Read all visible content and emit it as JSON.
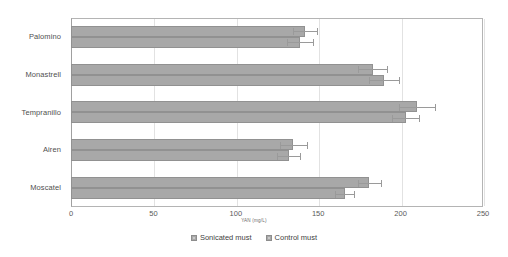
{
  "chart_data": {
    "type": "bar",
    "orientation": "horizontal",
    "title": "",
    "xlabel": "YAN (mg/L)",
    "ylabel": "",
    "xlim": [
      0,
      250
    ],
    "xticks": [
      0,
      50,
      100,
      150,
      200,
      250
    ],
    "grid": true,
    "legend_position": "bottom",
    "categories": [
      "Palomino",
      "Monastrell",
      "Tempranillo",
      "Airen",
      "Moscatel"
    ],
    "series": [
      {
        "name": "Sonicated must",
        "color": "#a8a8a8",
        "values": [
          142,
          183,
          210,
          135,
          181
        ],
        "errors": [
          7,
          9,
          11,
          8,
          7
        ]
      },
      {
        "name": "Control must",
        "color": "#a8a8a8",
        "values": [
          139,
          190,
          203,
          132,
          166
        ],
        "errors": [
          8,
          9,
          8,
          7,
          6
        ]
      }
    ]
  },
  "axis": {
    "x_tick_labels": [
      "0",
      "50",
      "100",
      "150",
      "200",
      "250"
    ],
    "x_title": "YAN (mg/L)"
  },
  "legend": {
    "items": [
      {
        "label": "Sonicated must"
      },
      {
        "label": "Control must"
      }
    ]
  }
}
